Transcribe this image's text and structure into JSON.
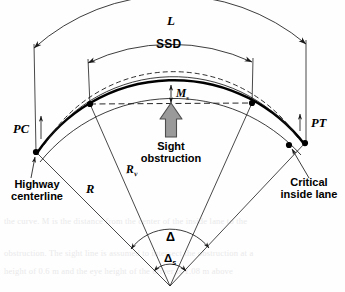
{
  "figure": {
    "name": "horizontal-curve-sight-distance-diagram",
    "colors": {
      "line": "#1a1a1a",
      "centerline": "#000000",
      "obstruction_fill": "#9a9a9a",
      "obstruction_stroke": "#4d4d4d",
      "background": "#ffffff",
      "ghost_text": "#e9e9ea"
    }
  },
  "labels": {
    "curve_length": "L",
    "sight_distance": "SSD",
    "middle_ordinate": "M",
    "middle_ordinate_sub": "s",
    "point_of_curve": "PC",
    "point_of_tangent": "PT",
    "radius_centerline": "R",
    "radius_vehicle": "R",
    "radius_vehicle_sub": "v",
    "central_angle": "Δ",
    "sight_angle": "Δ",
    "sight_angle_sub": "s",
    "obstruction_line1": "Sight",
    "obstruction_line2": "obstruction",
    "highway_centerline_line1": "Highway",
    "highway_centerline_line2": "centerline",
    "critical_lane_line1": "Critical",
    "critical_lane_line2": "inside lane"
  },
  "ghost_text": {
    "line1": "the curve. M  is the distance from the center of the inside lane to the",
    "line2": "obstruction. The sight line is assumed to intersect the obstruction at a",
    "line3": "height of 0.6 m and the eye height of the driver is 1.08 m above"
  },
  "geometry": {
    "center": {
      "x": 170,
      "y": 286
    },
    "radii": {
      "outer_dim_L": 208,
      "dim_ssd": 194,
      "outer_edge": 172,
      "centerline": 165,
      "inner_edge": 157,
      "vehicle_path": 150,
      "chord_level": 143
    },
    "angles_deg": {
      "pc": 232,
      "pt": 308,
      "ssd_left": 240,
      "ssd_right": 300
    },
    "points": {
      "pc_dot": {
        "x": 36,
        "y": 152
      },
      "pt_dot": {
        "x": 305,
        "y": 143
      },
      "ssd_left_dot": {
        "x": 90,
        "y": 104
      },
      "ssd_right_dot": {
        "x": 252,
        "y": 103
      },
      "critical_lane_dot": {
        "x": 289,
        "y": 145
      },
      "vertex": {
        "x": 170,
        "y": 286
      }
    }
  }
}
